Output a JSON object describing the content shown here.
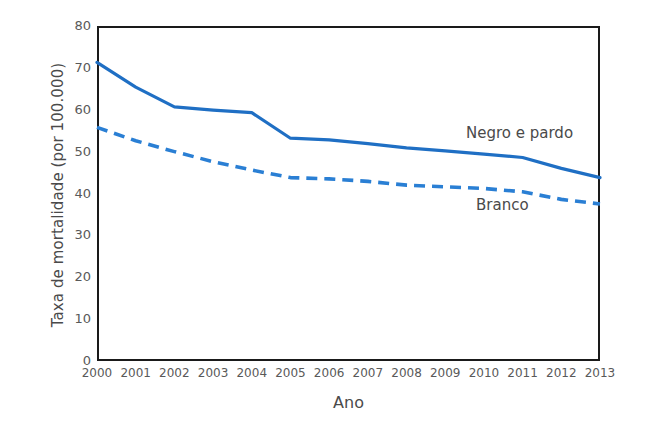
{
  "chart_data": {
    "type": "line",
    "title": "",
    "xlabel": "Ano",
    "ylabel": "Taxa de mortalidade (por 100.000)",
    "x": [
      2000,
      2001,
      2002,
      2003,
      2004,
      2005,
      2006,
      2007,
      2008,
      2009,
      2010,
      2011,
      2012,
      2013
    ],
    "xticklabels": [
      "2000",
      "2001",
      "2002",
      "2003",
      "2004",
      "2005",
      "2006",
      "2007",
      "2008",
      "2009",
      "2010",
      "2011",
      "2012",
      "2013"
    ],
    "yticklabels": [
      "0",
      "10",
      "20",
      "30",
      "40",
      "50",
      "60",
      "70",
      "80"
    ],
    "yticks": [
      0,
      10,
      20,
      30,
      40,
      50,
      60,
      70,
      80
    ],
    "ylim": [
      0,
      80
    ],
    "xlim": [
      2000,
      2013
    ],
    "grid": false,
    "legend_position": "inline-annotations",
    "series": [
      {
        "name": "Negro e pardo",
        "style": "solid",
        "color": "#1f6fc4",
        "values": [
          71.3,
          65.4,
          60.7,
          59.9,
          59.3,
          53.2,
          52.8,
          51.9,
          50.9,
          50.2,
          49.4,
          48.6,
          46.0,
          43.8
        ]
      },
      {
        "name": "Branco",
        "style": "dashed",
        "color": "#2a7fd4",
        "values": [
          55.8,
          52.6,
          50.0,
          47.6,
          45.6,
          43.8,
          43.5,
          42.9,
          42.0,
          41.6,
          41.2,
          40.4,
          38.6,
          37.5
        ]
      }
    ],
    "annotations": [
      {
        "text": "Negro e pardo",
        "x": 2010.5,
        "y": 56.5
      },
      {
        "text": "Branco",
        "x": 2011.0,
        "y": 39.0
      }
    ]
  }
}
